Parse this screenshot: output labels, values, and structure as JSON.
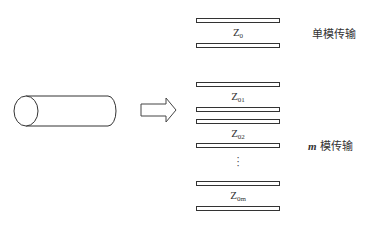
{
  "diagram": {
    "source": {
      "shape": "cylinder",
      "description": "cable"
    },
    "arrow": {
      "direction": "right"
    },
    "single_mode": {
      "label": "单模传输",
      "lines": [
        {
          "impedance_base": "Z",
          "impedance_sub": "0"
        }
      ]
    },
    "multi_mode": {
      "label_var": "m",
      "label_text": " 模传输",
      "lines": [
        {
          "impedance_base": "Z",
          "impedance_sub": "01"
        },
        {
          "impedance_base": "Z",
          "impedance_sub": "02"
        },
        {
          "impedance_base": "Z",
          "impedance_sub": "0m"
        }
      ],
      "ellipsis": "⋮"
    }
  }
}
